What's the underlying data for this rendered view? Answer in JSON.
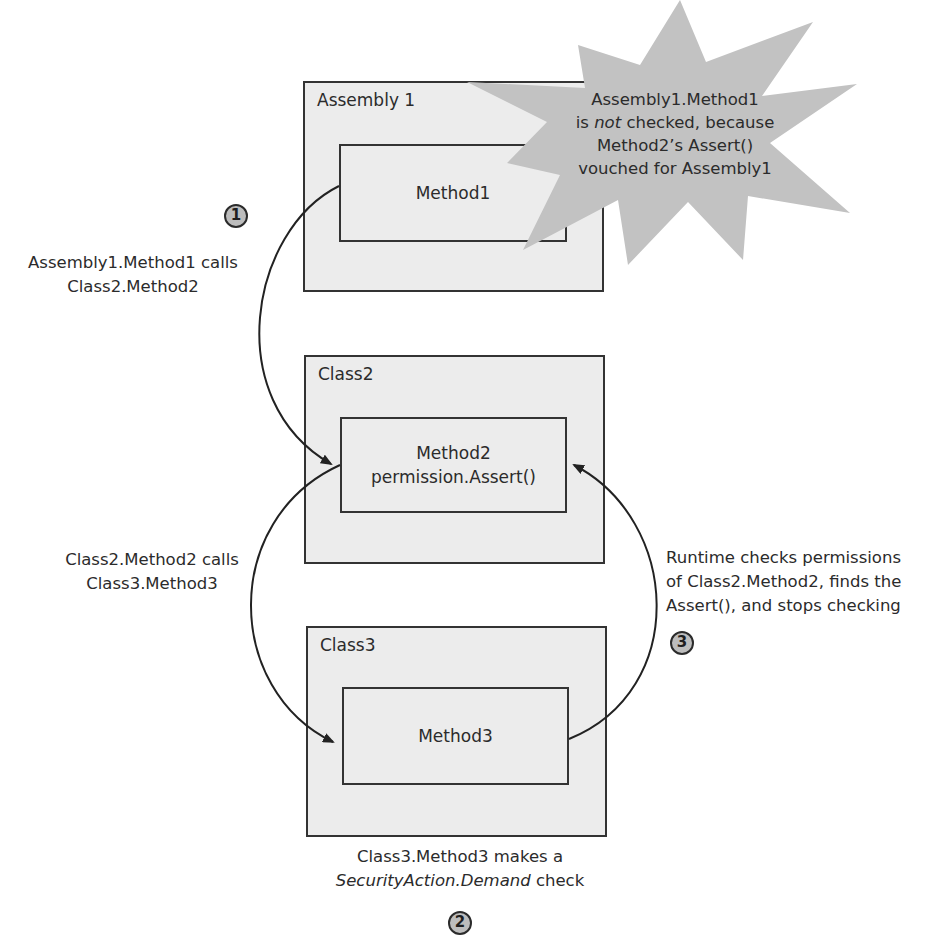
{
  "diagram": {
    "boxes": {
      "assembly1": {
        "title": "Assembly 1",
        "method": [
          "Method1"
        ]
      },
      "class2": {
        "title": "Class2",
        "method": [
          "Method2",
          "permission.Assert()"
        ]
      },
      "class3": {
        "title": "Class3",
        "method": [
          "Method3"
        ]
      }
    },
    "callout": {
      "line1": "Assembly1.Method1",
      "line2_pre": "is ",
      "line2_em": "not",
      "line2_post": " checked, because",
      "line3": "Method2’s Assert()",
      "line4": "vouched for Assembly1"
    },
    "labels": {
      "step1": [
        "Assembly1.Method1 calls",
        "Class2.Method2"
      ],
      "step_call2": [
        "Class2.Method2 calls",
        "Class3.Method3"
      ],
      "step2_line1": "Class3.Method3 makes a",
      "step2_line2_em": "SecurityAction.Demand",
      "step2_line2_post": " check",
      "step3": [
        "Runtime checks permissions",
        "of Class2.Method2, finds the",
        "Assert(), and stops checking"
      ]
    },
    "markers": {
      "m1": "1",
      "m2": "2",
      "m3": "3"
    },
    "colors": {
      "box_fill": "#ececec",
      "border": "#333333",
      "star_fill": "#c2c2c2",
      "marker_fill": "#bdbdbd",
      "text": "#2b2b2b"
    }
  }
}
